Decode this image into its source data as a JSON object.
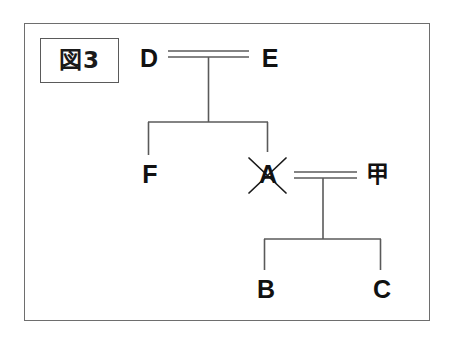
{
  "figure": {
    "caption_label": "図3",
    "frame": {
      "border_color": "#6e6e6e",
      "background": "#ffffff"
    },
    "line_color": "#5a5a5a",
    "text_color": "#111111"
  },
  "persons": [
    {
      "id": "D",
      "label": "D",
      "generation": 1,
      "deceased": false,
      "x": 148,
      "y": 48
    },
    {
      "id": "E",
      "label": "E",
      "generation": 1,
      "deceased": false,
      "x": 253,
      "y": 48
    },
    {
      "id": "F",
      "label": "F",
      "generation": 2,
      "deceased": false,
      "x": 140,
      "y": 163
    },
    {
      "id": "A",
      "label": "A",
      "generation": 2,
      "deceased": true,
      "x": 252,
      "y": 163
    },
    {
      "id": "KOU",
      "label": "甲",
      "generation": 2,
      "deceased": false,
      "x": 365,
      "y": 163
    },
    {
      "id": "B",
      "label": "B",
      "generation": 3,
      "deceased": false,
      "x": 252,
      "y": 278
    },
    {
      "id": "C",
      "label": "C",
      "generation": 3,
      "deceased": false,
      "x": 368,
      "y": 278
    }
  ],
  "marriages": [
    {
      "id": "D-E",
      "spouse_left": "D",
      "spouse_right": "E",
      "style": "double-line",
      "children": [
        "F",
        "A"
      ]
    },
    {
      "id": "A-KOU",
      "spouse_left": "A",
      "spouse_right": "甲",
      "style": "double-line",
      "children": [
        "B",
        "C"
      ]
    }
  ],
  "annotations": {
    "deceased_marker": "cross-x",
    "deceased_person": "A"
  }
}
